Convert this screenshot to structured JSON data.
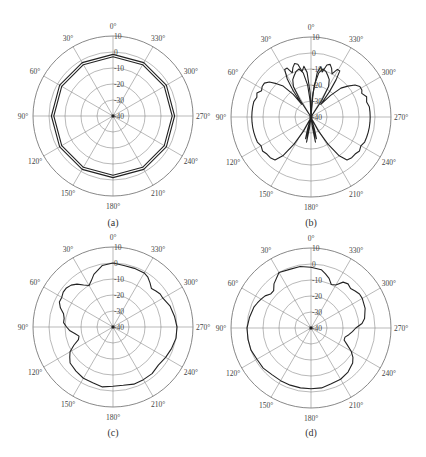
{
  "figure": {
    "panels_label": "Four polar radiation patterns (dB)"
  },
  "chart_data": [
    {
      "type": "line",
      "subtype": "polar",
      "caption": "(a)",
      "angle_direction": "counter-clockwise",
      "zero_angle": "top",
      "angle_ticks": [
        "0°",
        "30°",
        "60°",
        "90°",
        "120°",
        "150°",
        "180°",
        "210°",
        "240°",
        "270°",
        "300°",
        "330°"
      ],
      "radial_ticks": [
        "10",
        "0",
        "-10",
        "-20",
        "-30",
        "-40"
      ],
      "rlim": [
        -40,
        10
      ],
      "grid": true,
      "series": [
        {
          "name": "trace-1",
          "theta_deg": [
            0,
            30,
            60,
            90,
            120,
            150,
            180,
            210,
            240,
            270,
            300,
            330,
            360
          ],
          "r_db": [
            -1.5,
            -1.5,
            -1.5,
            -1.5,
            -1.5,
            -1.5,
            -1.5,
            -1.5,
            -1.5,
            -1.5,
            -1.5,
            -1.5,
            -1.5
          ]
        },
        {
          "name": "trace-2",
          "theta_deg": [
            0,
            30,
            60,
            90,
            120,
            150,
            180,
            210,
            240,
            270,
            300,
            330,
            360
          ],
          "r_db": [
            -3,
            -3,
            -3,
            -3,
            -3,
            -3,
            -3,
            -3,
            -3,
            -3,
            -3,
            -3,
            -3
          ]
        }
      ]
    },
    {
      "type": "line",
      "subtype": "polar",
      "caption": "(b)",
      "angle_direction": "counter-clockwise",
      "zero_angle": "top",
      "angle_ticks": [
        "0°",
        "30°",
        "60°",
        "90°",
        "120°",
        "150°",
        "180°",
        "210°",
        "240°",
        "270°",
        "300°",
        "330°"
      ],
      "radial_ticks": [
        "10",
        "0",
        "-10",
        "-20",
        "-30",
        "-40"
      ],
      "rlim": [
        -40,
        10
      ],
      "grid": true,
      "series": [
        {
          "name": "trace-1",
          "theta_deg": [
            0,
            2,
            5,
            8,
            11,
            14,
            17,
            20,
            23,
            26,
            29,
            32,
            34,
            36,
            38,
            42,
            46,
            50,
            54,
            58,
            62,
            66,
            70,
            75,
            80,
            85,
            90,
            95,
            100,
            105,
            110,
            115,
            120,
            125,
            130,
            135,
            140,
            144,
            148,
            152,
            156,
            160,
            164,
            166,
            168,
            170,
            172,
            174,
            176,
            178,
            180,
            182,
            184,
            186,
            188,
            190,
            192,
            194,
            196,
            200,
            204,
            208,
            212,
            216,
            220,
            225,
            230,
            235,
            240,
            245,
            250,
            255,
            260,
            265,
            270,
            275,
            280,
            285,
            290,
            295,
            298,
            302,
            306,
            310,
            314,
            318,
            322,
            324,
            326,
            328,
            331,
            334,
            337,
            340,
            343,
            346,
            349,
            352,
            355,
            358,
            360
          ],
          "r_db": [
            -40,
            -25,
            -12,
            -8,
            -11,
            -6,
            -5,
            -7,
            -10,
            -6,
            -6,
            -12,
            -20,
            -30,
            -22,
            -14,
            -10,
            -6,
            -4,
            -4,
            -5,
            -3,
            -4,
            -3,
            -3,
            -3,
            -3,
            -3,
            -3,
            -3,
            -3,
            -3,
            -4,
            -3,
            -4,
            -4,
            -5,
            -10,
            -20,
            -30,
            -38,
            -40,
            -32,
            -26,
            -34,
            -24,
            -33,
            -38,
            -40,
            -38,
            -40,
            -38,
            -40,
            -38,
            -33,
            -24,
            -34,
            -26,
            -32,
            -40,
            -38,
            -30,
            -20,
            -10,
            -5,
            -4,
            -4,
            -3,
            -4,
            -3,
            -3,
            -3,
            -3,
            -3,
            -3,
            -3,
            -3,
            -4,
            -3,
            -5,
            -4,
            -4,
            -6,
            -10,
            -14,
            -22,
            -30,
            -20,
            -12,
            -6,
            -6,
            -10,
            -7,
            -5,
            -6,
            -11,
            -8,
            -12,
            -25,
            -40,
            -40
          ]
        },
        {
          "name": "trace-2",
          "theta_deg": [
            0,
            3,
            6,
            10,
            14,
            18,
            22,
            26,
            30,
            33,
            35,
            325,
            327,
            330,
            334,
            338,
            342,
            346,
            350,
            354,
            357,
            360
          ],
          "r_db": [
            -40,
            -30,
            -20,
            -12,
            -9,
            -10,
            -12,
            -14,
            -18,
            -28,
            -40,
            -40,
            -28,
            -18,
            -14,
            -12,
            -10,
            -9,
            -12,
            -20,
            -30,
            -40
          ]
        }
      ]
    },
    {
      "type": "line",
      "subtype": "polar",
      "caption": "(c)",
      "angle_direction": "counter-clockwise",
      "zero_angle": "top",
      "angle_ticks": [
        "0°",
        "30°",
        "60°",
        "90°",
        "120°",
        "150°",
        "180°",
        "210°",
        "240°",
        "270°",
        "300°",
        "330°"
      ],
      "radial_ticks": [
        "10",
        "0",
        "-10",
        "-20",
        "-30",
        "-40"
      ],
      "rlim": [
        -40,
        10
      ],
      "grid": true,
      "series": [
        {
          "name": "trace-1",
          "theta_deg": [
            0,
            10,
            20,
            25,
            30,
            35,
            40,
            45,
            50,
            55,
            60,
            65,
            70,
            75,
            80,
            85,
            90,
            95,
            100,
            105,
            110,
            115,
            120,
            125,
            130,
            140,
            150,
            160,
            170,
            180,
            190,
            200,
            210,
            220,
            230,
            240,
            250,
            260,
            270,
            280,
            290,
            300,
            305,
            310,
            315,
            320,
            325,
            330,
            340,
            350,
            360
          ],
          "r_db": [
            0,
            -1,
            -5,
            -8,
            -10,
            -8,
            -5,
            -3,
            -2,
            -2,
            -3,
            -3,
            -5,
            -8,
            -9,
            -9,
            -11,
            -13,
            -16,
            -18,
            -17,
            -13,
            -9,
            -7,
            -5,
            -4,
            -3,
            -3,
            -2,
            -3,
            -3,
            -2,
            -2,
            -2,
            -3,
            -2,
            -1,
            0,
            0,
            -1,
            -2,
            -4,
            -4,
            -5,
            -6,
            -4,
            -2,
            -1,
            -1,
            -1,
            0
          ]
        }
      ]
    },
    {
      "type": "line",
      "subtype": "polar",
      "caption": "(d)",
      "angle_direction": "counter-clockwise",
      "zero_angle": "top",
      "angle_ticks": [
        "0°",
        "30°",
        "60°",
        "90°",
        "120°",
        "150°",
        "180°",
        "210°",
        "240°",
        "270°",
        "300°",
        "330°"
      ],
      "radial_ticks": [
        "10",
        "0",
        "-10",
        "-20",
        "-30",
        "-40"
      ],
      "rlim": [
        -40,
        10
      ],
      "grid": true,
      "series": [
        {
          "name": "trace-1",
          "theta_deg": [
            0,
            10,
            20,
            30,
            40,
            45,
            50,
            55,
            60,
            65,
            70,
            80,
            90,
            100,
            110,
            120,
            130,
            140,
            150,
            160,
            170,
            180,
            190,
            200,
            210,
            220,
            230,
            235,
            240,
            245,
            250,
            255,
            260,
            265,
            270,
            275,
            280,
            290,
            300,
            305,
            310,
            315,
            320,
            325,
            330,
            335,
            340,
            345,
            350,
            360
          ],
          "r_db": [
            -2,
            -1,
            -1,
            0,
            -4,
            -7,
            -7,
            -5,
            -4,
            -3,
            -2,
            -1,
            0,
            0,
            0,
            -1,
            -1,
            -2,
            -2,
            -2,
            -2,
            -2,
            -2,
            -3,
            -3,
            -4,
            -6,
            -8,
            -11,
            -15,
            -18,
            -18,
            -16,
            -14,
            -12,
            -8,
            -6,
            -4,
            -3,
            -3,
            -4,
            -5,
            -4,
            -5,
            -9,
            -10,
            -7,
            -5,
            -3,
            -2
          ]
        }
      ]
    }
  ]
}
